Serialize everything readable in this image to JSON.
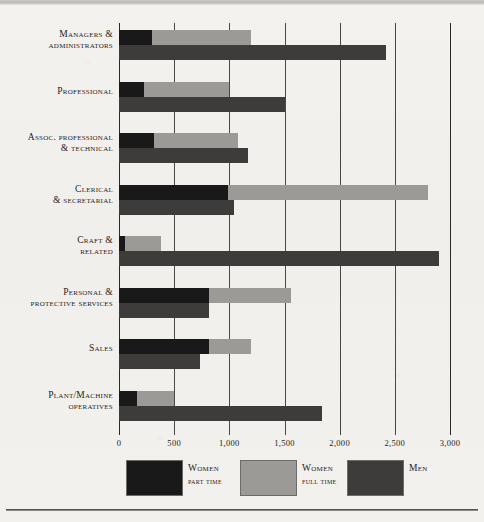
{
  "chart_data": {
    "type": "bar",
    "orientation": "horizontal",
    "title": "",
    "xlabel": "",
    "ylabel": "",
    "xlim": [
      0,
      3000
    ],
    "xticks": [
      0,
      500,
      1000,
      1500,
      2000,
      2500,
      3000
    ],
    "xtick_labels": [
      "0",
      "500",
      "1,000",
      "1,500",
      "2,000",
      "2,500",
      "3,000"
    ],
    "grid": true,
    "legend_position": "bottom",
    "stacked_series": [
      "Women part time",
      "Women full time"
    ],
    "categories": [
      "Managers & administrators",
      "Professional",
      "Assoc. professional & technical",
      "Clerical & secretarial",
      "Craft & related",
      "Personal & protective services",
      "Sales",
      "Plant/Machine operatives"
    ],
    "series": [
      {
        "name": "Women part time",
        "color": "#191919",
        "values": [
          300,
          230,
          320,
          990,
          55,
          820,
          820,
          160
        ]
      },
      {
        "name": "Women full time",
        "color": "#9c9a97",
        "values": [
          900,
          770,
          760,
          1810,
          325,
          740,
          380,
          340
        ]
      },
      {
        "name": "Men",
        "color": "#3e3c3a",
        "values": [
          2420,
          1500,
          1170,
          1040,
          2900,
          820,
          730,
          1840
        ]
      }
    ],
    "women_totals": [
      1200,
      1000,
      1080,
      2800,
      380,
      1560,
      1200,
      500
    ]
  },
  "categories": [
    {
      "line1": "Managers &",
      "line2": "administrators"
    },
    {
      "line1": "Professional",
      "line2": ""
    },
    {
      "line1": "Assoc. professional",
      "line2": "& technical"
    },
    {
      "line1": "Clerical",
      "line2": "& secretarial"
    },
    {
      "line1": "Craft &",
      "line2": "related"
    },
    {
      "line1": "Personal &",
      "line2": "protective services"
    },
    {
      "line1": "Sales",
      "line2": ""
    },
    {
      "line1": "Plant/Machine",
      "line2": "operatives"
    }
  ],
  "legend": {
    "items": [
      {
        "line1": "Women",
        "line2": "part time",
        "color": "#191919"
      },
      {
        "line1": "Women",
        "line2": "full time",
        "color": "#9c9a97"
      },
      {
        "line1": "Men",
        "line2": "",
        "color": "#3e3c3a"
      }
    ]
  },
  "colors": {
    "background": "#f2f0ed",
    "axis": "#2a2a2a",
    "text": "#1f1d1b",
    "women_part_time": "#191919",
    "women_full_time": "#9c9a97",
    "men": "#3e3c3a"
  }
}
